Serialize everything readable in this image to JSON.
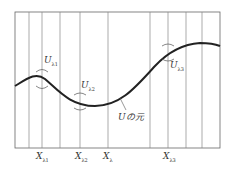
{
  "diagram": {
    "curve_label": "Uの元",
    "neighborhoods": [
      {
        "name": "U",
        "sub": "λ1"
      },
      {
        "name": "U",
        "sub": "λ2"
      },
      {
        "name": "U",
        "sub": "λ3"
      }
    ],
    "x_labels": [
      {
        "name": "X",
        "sub": "λ1"
      },
      {
        "name": "X",
        "sub": "λ2"
      },
      {
        "name": "X",
        "sub": "λ"
      },
      {
        "name": "X",
        "sub": "λ3"
      }
    ],
    "colors": {
      "line": "#333333",
      "grid": "#777777",
      "bg": "#ffffff"
    }
  }
}
